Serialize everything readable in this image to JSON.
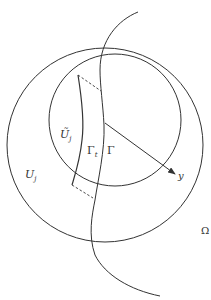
{
  "diagram": {
    "colors": {
      "stroke": "#333333",
      "background": "#ffffff"
    },
    "labels": {
      "u_tilde_j": "Ũ",
      "u_tilde_j_sub": "j",
      "gamma_t": "Γ",
      "gamma_t_sub": "t",
      "gamma": "Γ",
      "u_j": "U",
      "u_j_sub": "j",
      "y": "y",
      "omega": "Ω"
    }
  }
}
